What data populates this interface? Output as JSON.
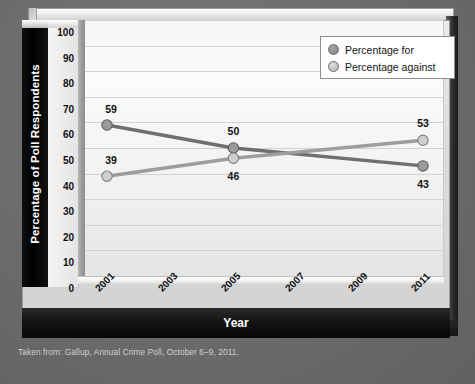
{
  "chart_data": {
    "type": "line",
    "title": "",
    "xlabel": "Year",
    "ylabel": "Percentage of Poll Respondents",
    "ylim": [
      0,
      100
    ],
    "ytick_step": 10,
    "grid": true,
    "legend_position": "top-right",
    "x_tick_labels": [
      "2001",
      "2003",
      "2005",
      "2007",
      "2009",
      "2011"
    ],
    "x": [
      2001,
      2005,
      2011
    ],
    "series": [
      {
        "name": "Percentage for",
        "color": "#8a8a8a",
        "values": [
          59,
          50,
          43
        ],
        "point_labels": [
          "59",
          "50",
          "43"
        ]
      },
      {
        "name": "Percentage against",
        "color": "#bdbdbd",
        "values": [
          39,
          46,
          53
        ],
        "point_labels": [
          "39",
          "46",
          "53"
        ]
      }
    ],
    "y_tick_labels": [
      "100",
      "90",
      "80",
      "70",
      "60",
      "50",
      "40",
      "30",
      "20",
      "10",
      "0"
    ]
  },
  "axes": {
    "y_title": "Percentage of Poll Respondents",
    "x_title": "Year",
    "y_ticks": [
      "100",
      "90",
      "80",
      "70",
      "60",
      "50",
      "40",
      "30",
      "20",
      "10",
      "0"
    ],
    "x_ticks": [
      "2001",
      "2003",
      "2005",
      "2007",
      "2009",
      "2011"
    ]
  },
  "legend": {
    "items": [
      {
        "label": "Percentage for",
        "swatch": "legend-dot-for"
      },
      {
        "label": "Percentage against",
        "swatch": "legend-dot-against"
      }
    ]
  },
  "point_labels": {
    "for_2001": "59",
    "for_2005": "50",
    "for_2011": "43",
    "against_2001": "39",
    "against_2005": "46",
    "against_2011": "53"
  },
  "source": {
    "note": "Taken from: Gallup, Annual Crime Poll, October 6–9, 2011."
  },
  "colors": {
    "series_for": "#8a8a8a",
    "series_against": "#c0c0c0",
    "plot_background": "#f4f4f4",
    "page_background": "#6f6f6f",
    "axis_band": "#000000",
    "text_light": "#ffffff"
  }
}
